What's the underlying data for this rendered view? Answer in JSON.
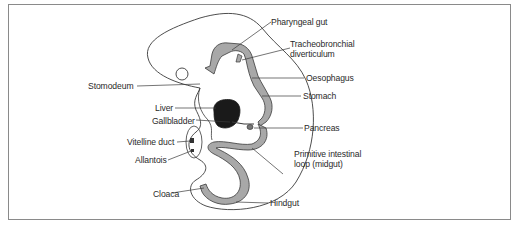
{
  "figure": {
    "type": "embryo-gut-development",
    "labels": {
      "pharyngeal_gut": "Pharyngeal gut",
      "tracheobronchial_line1": "Tracheobronchial",
      "tracheobronchial_line2": "diverticulum",
      "oesophagus": "Oesophagus",
      "stomodeum": "Stomodeum",
      "stomach": "Stomach",
      "liver": "Liver",
      "gallbladder": "Gallbladder",
      "pancreas": "Pancreas",
      "vitelline_duct": "Vitelline duct",
      "allantois": "Allantois",
      "primitive_intestinal_line1": "Primitive intestinal",
      "primitive_intestinal_line2": "loop (midgut)",
      "cloaca": "Cloaca",
      "hindgut": "Hindgut"
    },
    "colors": {
      "gut_fill": "#a8a8a8",
      "liver_fill": "#1a1a1a",
      "outline": "#3a3a3a",
      "border": "#8a8a8a"
    }
  }
}
